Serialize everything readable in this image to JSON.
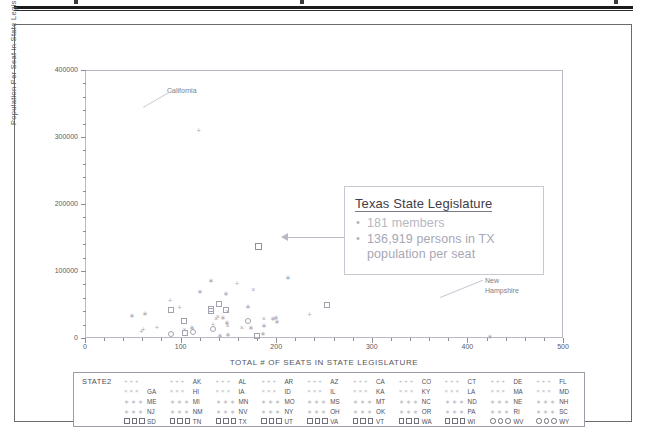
{
  "document": {
    "has_top_rule": true
  },
  "chart_data": {
    "type": "scatter",
    "title": "",
    "xlabel": "TOTAL # OF SEATS IN STATE LEGISLATURE",
    "ylabel": "Population Per Seat in State Legislature",
    "xlim": [
      0,
      500
    ],
    "ylim": [
      0,
      400000
    ],
    "xticks": [
      0,
      100,
      200,
      300,
      400,
      500
    ],
    "xtick_labels": [
      "0",
      "100",
      "200",
      "300",
      "400",
      "500"
    ],
    "yticks": [
      0,
      100000,
      200000,
      300000,
      400000
    ],
    "ytick_labels": [
      "0",
      "100000",
      "200000",
      "300000",
      "400000"
    ],
    "grid": false,
    "legend_position": "below-plot",
    "annotations": [
      {
        "text": "California",
        "x": 120,
        "y": 310000
      },
      {
        "text": "New Hampshire",
        "x": 424,
        "y": 23000
      }
    ],
    "points": [
      {
        "state": "CA",
        "x": 120,
        "y": 310000,
        "marker": "plus"
      },
      {
        "state": "TX",
        "x": 181,
        "y": 136919,
        "marker": "square"
      },
      {
        "state": "NY",
        "x": 212,
        "y": 91000,
        "marker": "star"
      },
      {
        "state": "FL",
        "x": 160,
        "y": 82000,
        "marker": "plus"
      },
      {
        "state": "OH",
        "x": 132,
        "y": 86000,
        "marker": "star"
      },
      {
        "state": "IL",
        "x": 177,
        "y": 73000,
        "marker": "cross"
      },
      {
        "state": "PA",
        "x": 253,
        "y": 49000,
        "marker": "square"
      },
      {
        "state": "MI",
        "x": 148,
        "y": 67000,
        "marker": "star"
      },
      {
        "state": "NJ",
        "x": 120,
        "y": 70000,
        "marker": "star"
      },
      {
        "state": "NC",
        "x": 170,
        "y": 48000,
        "marker": "star"
      },
      {
        "state": "GA",
        "x": 236,
        "y": 36000,
        "marker": "plus"
      },
      {
        "state": "VA",
        "x": 140,
        "y": 51000,
        "marker": "square"
      },
      {
        "state": "WA",
        "x": 147,
        "y": 42000,
        "marker": "square"
      },
      {
        "state": "AZ",
        "x": 90,
        "y": 57000,
        "marker": "plus"
      },
      {
        "state": "MA",
        "x": 200,
        "y": 32000,
        "marker": "star"
      },
      {
        "state": "IN",
        "x": 150,
        "y": 41000,
        "marker": "cross"
      },
      {
        "state": "TN",
        "x": 132,
        "y": 44000,
        "marker": "square"
      },
      {
        "state": "MO",
        "x": 197,
        "y": 30000,
        "marker": "star"
      },
      {
        "state": "MD",
        "x": 188,
        "y": 30000,
        "marker": "cross"
      },
      {
        "state": "WI",
        "x": 132,
        "y": 41000,
        "marker": "square"
      },
      {
        "state": "MN",
        "x": 201,
        "y": 26000,
        "marker": "star"
      },
      {
        "state": "CO",
        "x": 100,
        "y": 47000,
        "marker": "plus"
      },
      {
        "state": "AL",
        "x": 140,
        "y": 33000,
        "marker": "cross"
      },
      {
        "state": "SC",
        "x": 170,
        "y": 26000,
        "marker": "circle"
      },
      {
        "state": "LA",
        "x": 144,
        "y": 31000,
        "marker": "star"
      },
      {
        "state": "KY",
        "x": 138,
        "y": 30000,
        "marker": "cross"
      },
      {
        "state": "OR",
        "x": 90,
        "y": 42000,
        "marker": "square"
      },
      {
        "state": "OK",
        "x": 149,
        "y": 24000,
        "marker": "star"
      },
      {
        "state": "CT",
        "x": 187,
        "y": 19000,
        "marker": "star"
      },
      {
        "state": "IA",
        "x": 150,
        "y": 20000,
        "marker": "cross"
      },
      {
        "state": "MS",
        "x": 174,
        "y": 17000,
        "marker": "star"
      },
      {
        "state": "AR",
        "x": 135,
        "y": 21000,
        "marker": "plus"
      },
      {
        "state": "KS",
        "x": 165,
        "y": 17000,
        "marker": "cross"
      },
      {
        "state": "UT",
        "x": 104,
        "y": 26000,
        "marker": "square"
      },
      {
        "state": "NV",
        "x": 63,
        "y": 38000,
        "marker": "star"
      },
      {
        "state": "NM",
        "x": 112,
        "y": 17000,
        "marker": "star"
      },
      {
        "state": "WV",
        "x": 134,
        "y": 13000,
        "marker": "circle"
      },
      {
        "state": "NE",
        "x": 49,
        "y": 35000,
        "marker": "star"
      },
      {
        "state": "ID",
        "x": 105,
        "y": 14000,
        "marker": "cross"
      },
      {
        "state": "ME",
        "x": 186,
        "y": 7000,
        "marker": "star"
      },
      {
        "state": "NH",
        "x": 424,
        "y": 3100,
        "marker": "star"
      },
      {
        "state": "HI",
        "x": 76,
        "y": 16000,
        "marker": "plus"
      },
      {
        "state": "RI",
        "x": 113,
        "y": 9400,
        "marker": "circle"
      },
      {
        "state": "MT",
        "x": 150,
        "y": 6100,
        "marker": "star"
      },
      {
        "state": "DE",
        "x": 62,
        "y": 13000,
        "marker": "plus"
      },
      {
        "state": "SD",
        "x": 105,
        "y": 7700,
        "marker": "square"
      },
      {
        "state": "ND",
        "x": 141,
        "y": 4800,
        "marker": "star"
      },
      {
        "state": "AK",
        "x": 60,
        "y": 11000,
        "marker": "plus"
      },
      {
        "state": "VT",
        "x": 180,
        "y": 3400,
        "marker": "square"
      },
      {
        "state": "WY",
        "x": 90,
        "y": 6000,
        "marker": "circle"
      }
    ]
  },
  "callout": {
    "title": "Texas State Legislature",
    "bullets": [
      "181 members",
      "136,919 persons in TX population per seat"
    ],
    "bullet_glyph": "•"
  },
  "legend": {
    "title": "STATE2",
    "rows": [
      {
        "symbol": "plus",
        "states": [
          "",
          "AK",
          "AL",
          "AR",
          "AZ",
          "CA",
          "CO",
          "CT",
          "DE",
          "FL"
        ]
      },
      {
        "symbol": "cross",
        "states": [
          "GA",
          "HI",
          "IA",
          "ID",
          "IL",
          "KA",
          "KY",
          "LA",
          "MA",
          "MD"
        ]
      },
      {
        "symbol": "star",
        "states": [
          "ME",
          "MI",
          "MN",
          "MO",
          "MS",
          "MT",
          "NC",
          "ND",
          "NE",
          "NH"
        ]
      },
      {
        "symbol": "star",
        "states": [
          "NJ",
          "NM",
          "NV",
          "NY",
          "OH",
          "OK",
          "OR",
          "PA",
          "RI",
          "SC"
        ]
      },
      {
        "symbol": "square",
        "states": [
          "SD",
          "TN",
          "TX",
          "UT",
          "VA",
          "VT",
          "WA",
          "WI",
          "WV",
          "WY"
        ]
      }
    ],
    "row5_circle_from": 8
  }
}
